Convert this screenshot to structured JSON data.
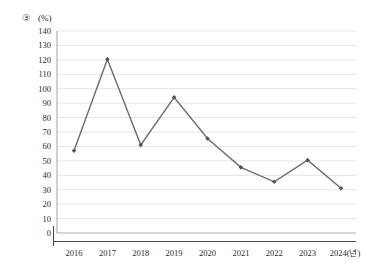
{
  "annotation": {
    "marker": "③",
    "unit": "(%)"
  },
  "chart_data": {
    "type": "line",
    "title": "",
    "subtitle": "",
    "xlabel": "",
    "ylabel": "(%)",
    "categories": [
      "2016",
      "2017",
      "2018",
      "2019",
      "2020",
      "2021",
      "2022",
      "2023",
      "2024(년)"
    ],
    "values": [
      57,
      120.5,
      61,
      94,
      65.5,
      45.5,
      35.5,
      50.5,
      31
    ],
    "series": [
      {
        "name": "",
        "values": [
          57,
          120.5,
          61,
          94,
          65.5,
          45.5,
          35.5,
          50.5,
          31
        ]
      }
    ],
    "ylim": [
      0,
      140
    ],
    "ytick_step": 10,
    "yticks": [
      "140",
      "130",
      "120",
      "110",
      "100",
      "90",
      "80",
      "70",
      "60",
      "50",
      "40",
      "30",
      "20",
      "10",
      "0"
    ],
    "xticks": [
      "2016",
      "2017",
      "2018",
      "2019",
      "2020",
      "2021",
      "2022",
      "2023",
      "2024(년)"
    ],
    "grid": true,
    "grid_axis": "y",
    "legend": false,
    "legend_position": "none",
    "marker_style": "diamond",
    "line_color": "#6b6b6b",
    "marker_color": "#545454",
    "grid_color": "#d9d9d9",
    "annotations": [
      "③"
    ]
  }
}
